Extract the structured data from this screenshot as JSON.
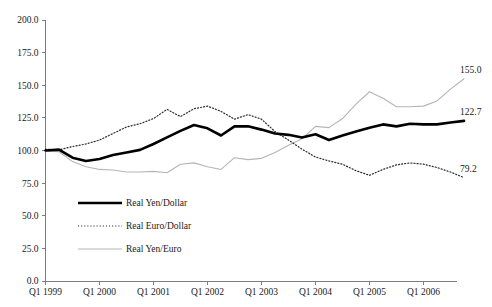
{
  "chart_data": {
    "type": "line",
    "title": "",
    "subtitle": "",
    "xlabel": "",
    "ylabel": "",
    "ylim": [
      0.0,
      200.0
    ],
    "grid": false,
    "legend_position": "inside-lower-left",
    "y_ticks": [
      "0.0",
      "25.0",
      "50.0",
      "75.0",
      "100.0",
      "125.0",
      "150.0",
      "175.0",
      "200.0"
    ],
    "y_tick_values": [
      0,
      25,
      50,
      75,
      100,
      125,
      150,
      175,
      200
    ],
    "x_ticks": [
      "Q1 1999",
      "Q1 2000",
      "Q1 2001",
      "Q1 2002",
      "Q1 2003",
      "Q1 2004",
      "Q1 2005",
      "Q1 2006"
    ],
    "x_tick_values": [
      0,
      4,
      8,
      12,
      16,
      20,
      24,
      28
    ],
    "x": [
      0,
      1,
      2,
      3,
      4,
      5,
      6,
      7,
      8,
      9,
      10,
      11,
      12,
      13,
      14,
      15,
      16,
      17,
      18,
      19,
      20,
      21,
      22,
      23,
      24,
      25,
      26,
      27,
      28,
      29,
      30,
      31
    ],
    "x_period_labels": [
      "Q1 1999",
      "Q2 1999",
      "Q3 1999",
      "Q4 1999",
      "Q1 2000",
      "Q2 2000",
      "Q3 2000",
      "Q4 2000",
      "Q1 2001",
      "Q2 2001",
      "Q3 2001",
      "Q4 2001",
      "Q1 2002",
      "Q2 2002",
      "Q3 2002",
      "Q4 2002",
      "Q1 2003",
      "Q2 2003",
      "Q3 2003",
      "Q4 2003",
      "Q1 2004",
      "Q2 2004",
      "Q3 2004",
      "Q4 2004",
      "Q1 2005",
      "Q2 2005",
      "Q3 2005",
      "Q4 2005",
      "Q1 2006",
      "Q2 2006",
      "Q3 2006",
      "Q4 2006"
    ],
    "series": [
      {
        "name": "Real Yen/Dollar",
        "style": "thick-solid-black",
        "color": "#000000",
        "end_label": "122.7",
        "values": [
          100.0,
          100.7,
          94.5,
          92.0,
          93.5,
          96.5,
          98.5,
          100.5,
          105.0,
          110.0,
          115.0,
          119.5,
          117.0,
          111.5,
          118.5,
          118.5,
          116.0,
          113.0,
          112.0,
          110.0,
          112.5,
          108.0,
          111.5,
          114.5,
          117.5,
          120.0,
          118.5,
          120.5,
          120.0,
          120.0,
          121.5,
          122.7
        ]
      },
      {
        "name": "Real Euro/Dollar",
        "style": "dotted-black",
        "color": "#333333",
        "end_label": "79.2",
        "values": [
          101.0,
          100.5,
          103.0,
          105.0,
          108.0,
          113.0,
          118.0,
          120.5,
          124.5,
          131.5,
          126.0,
          132.0,
          134.0,
          130.0,
          124.0,
          127.5,
          124.0,
          114.5,
          108.0,
          101.0,
          95.0,
          92.0,
          89.5,
          84.5,
          81.0,
          85.5,
          89.0,
          90.5,
          89.5,
          87.0,
          83.5,
          79.2
        ]
      },
      {
        "name": "Real Yen/Euro",
        "style": "thin-solid-gray",
        "color": "#b0b0b0",
        "end_label": "155.0",
        "values": [
          99.5,
          99.0,
          91.5,
          87.5,
          85.5,
          85.0,
          83.5,
          83.5,
          84.0,
          83.0,
          89.5,
          90.5,
          87.5,
          85.5,
          94.5,
          93.0,
          94.0,
          98.5,
          104.0,
          109.0,
          118.5,
          117.5,
          124.5,
          135.5,
          145.0,
          140.0,
          133.5,
          133.5,
          134.0,
          138.0,
          147.0,
          155.0
        ]
      }
    ],
    "end_labels": [
      {
        "text": "155.0",
        "series": "Real Yen/Euro"
      },
      {
        "text": "122.7",
        "series": "Real Yen/Dollar"
      },
      {
        "text": "79.2",
        "series": "Real Euro/Dollar"
      }
    ],
    "legend": [
      {
        "label": "Real Yen/Dollar",
        "style": "thick-solid-black"
      },
      {
        "label": "Real Euro/Dollar",
        "style": "dotted-black"
      },
      {
        "label": "Real Yen/Euro",
        "style": "thin-solid-gray"
      }
    ]
  }
}
